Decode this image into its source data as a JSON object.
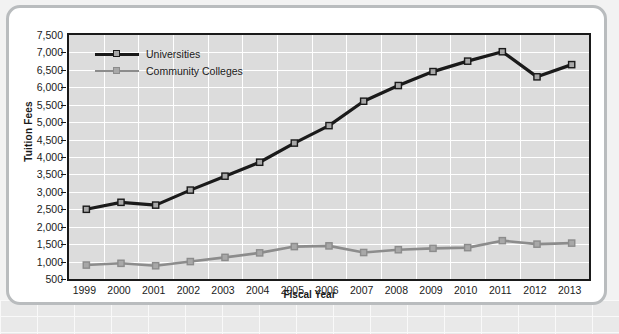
{
  "chart_data": {
    "type": "line",
    "title": "",
    "xlabel": "Fiscal Year",
    "ylabel": "Tuition Fees",
    "categories": [
      "1999",
      "2000",
      "2001",
      "2002",
      "2003",
      "2004",
      "2005",
      "2006",
      "2007",
      "2008",
      "2009",
      "2010",
      "2011",
      "2012",
      "2013"
    ],
    "ylim": [
      500,
      7500
    ],
    "ytick_step": 500,
    "yticks": [
      "7,500",
      "7,000",
      "6,500",
      "6,000",
      "5,500",
      "5,000",
      "4,500",
      "4,000",
      "3,500",
      "3,000",
      "2,500",
      "2,000",
      "1,500",
      "1,000",
      "500"
    ],
    "grid": true,
    "legend_position": "top-left",
    "series": [
      {
        "name": "Universities",
        "color": "#1a1a1a",
        "values": [
          2500,
          2700,
          2620,
          3050,
          3450,
          3850,
          4400,
          4900,
          5600,
          6050,
          6450,
          6750,
          7020,
          6300,
          6650
        ]
      },
      {
        "name": "Community Colleges",
        "color": "#8c8c8c",
        "values": [
          900,
          950,
          880,
          1000,
          1120,
          1250,
          1430,
          1450,
          1260,
          1340,
          1380,
          1400,
          1600,
          1500,
          1530
        ]
      }
    ]
  },
  "style": {
    "plot_background": "#dcdcdc",
    "gridline_color": "#ffffff",
    "axis_color": "#1a1a1a",
    "marker_fill": "#a8a8a8",
    "card_border": "#b9bcbe",
    "page_background": "#ffffff"
  }
}
